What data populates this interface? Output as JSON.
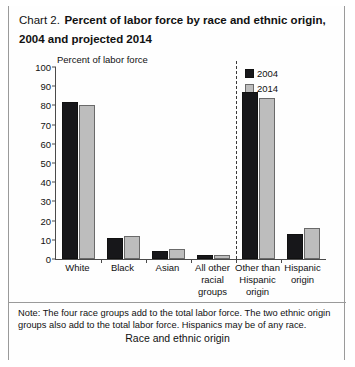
{
  "title": {
    "prefix": "Chart 2.",
    "main": "Percent of labor force by race and ethnic origin, 2004 and projected 2014"
  },
  "footnote": "Note: The four race groups add to the total labor force. The two ethnic origin groups also add to the total labor force. Hispanics may be of any race.",
  "colors": {
    "series_2004": "#17171a",
    "series_2014": "#bdbdbd",
    "axis": "#4a4a4a",
    "divider": "#3a3a3a"
  },
  "legend": {
    "items": [
      {
        "label": "2004",
        "key": "y2004"
      },
      {
        "label": "2014",
        "key": "y2014"
      }
    ]
  },
  "chart_data": {
    "type": "bar",
    "title": "Chart 2. Percent of labor force by race and ethnic origin, 2004 and projected 2014",
    "xlabel": "Race and ethnic origin",
    "ylabel": "Percent of labor force",
    "ylim": [
      0,
      100
    ],
    "yticks": [
      0,
      10,
      20,
      30,
      40,
      50,
      60,
      70,
      80,
      90,
      100
    ],
    "grid": false,
    "legend_position": "top-right",
    "categories": [
      "White",
      "Black",
      "Asian",
      "All other racial groups",
      "Other than Hispanic origin",
      "Hispanic origin"
    ],
    "category_lines": [
      [
        "White"
      ],
      [
        "Black"
      ],
      [
        "Asian"
      ],
      [
        "All other",
        "racial",
        "groups"
      ],
      [
        "Other than",
        "Hispanic",
        "origin"
      ],
      [
        "Hispanic",
        "origin"
      ]
    ],
    "series": [
      {
        "name": "2004",
        "values": [
          82,
          11,
          4,
          2,
          87,
          13
        ]
      },
      {
        "name": "2014",
        "values": [
          80,
          12,
          5,
          2,
          84,
          16
        ]
      }
    ],
    "annotations": [
      {
        "type": "vertical-dashed-divider",
        "after_category": "All other racial groups"
      }
    ]
  }
}
